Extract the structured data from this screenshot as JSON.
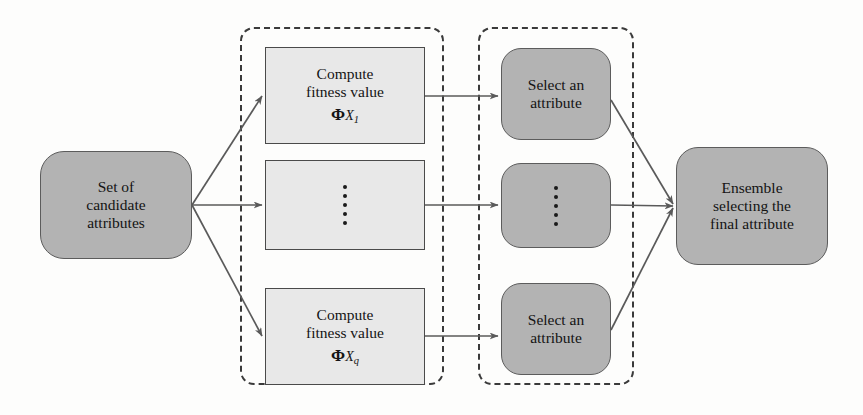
{
  "figure": {
    "type": "flow-diagram",
    "background_color": "#fdfdfc",
    "node_fill_round": "#b3b3b3",
    "node_fill_rect": "#e8e8e8",
    "edge_color": "#5a5a5a",
    "dashed_border_color": "#3a3a3a"
  },
  "nodes": {
    "candidates": {
      "id": "set-of-candidate-attributes",
      "shape": "rounded-rect",
      "lines": [
        "Set of",
        "candidate",
        "attributes"
      ]
    },
    "compute_first": {
      "id": "compute-fitness-value-x1",
      "shape": "rect",
      "lines": [
        "Compute",
        "fitness value"
      ],
      "symbol": "Φ",
      "symbol_var": "X",
      "symbol_sub": "1"
    },
    "compute_middle": {
      "id": "compute-fitness-ellipsis",
      "shape": "rect",
      "content": "vertical-ellipsis",
      "dots": 5
    },
    "compute_last": {
      "id": "compute-fitness-value-xq",
      "shape": "rect",
      "lines": [
        "Compute",
        "fitness value"
      ],
      "symbol": "Φ",
      "symbol_var": "X",
      "symbol_sub": "q"
    },
    "select_first": {
      "id": "select-an-attribute-top",
      "shape": "rounded-rect",
      "lines": [
        "Select an",
        "attribute"
      ]
    },
    "select_middle": {
      "id": "select-attribute-ellipsis",
      "shape": "rounded-rect",
      "content": "vertical-ellipsis",
      "dots": 5
    },
    "select_last": {
      "id": "select-an-attribute-bottom",
      "shape": "rounded-rect",
      "lines": [
        "Select an",
        "attribute"
      ]
    },
    "ensemble": {
      "id": "ensemble-selecting-final-attribute",
      "shape": "rounded-rect",
      "lines": [
        "Ensemble",
        "selecting the",
        "final attribute"
      ]
    }
  },
  "groups": {
    "compute_group": {
      "id": "compute-stage",
      "style": "dashed-rounded",
      "label": ""
    },
    "select_group": {
      "id": "select-stage",
      "style": "dashed-rounded",
      "label": ""
    }
  },
  "edges": [
    {
      "from": "candidates",
      "to": "compute_first",
      "style": "arrow"
    },
    {
      "from": "candidates",
      "to": "compute_middle",
      "style": "arrow"
    },
    {
      "from": "candidates",
      "to": "compute_last",
      "style": "arrow"
    },
    {
      "from": "compute_first",
      "to": "select_first",
      "style": "arrow"
    },
    {
      "from": "compute_middle",
      "to": "select_middle",
      "style": "arrow"
    },
    {
      "from": "compute_last",
      "to": "select_last",
      "style": "arrow"
    },
    {
      "from": "select_first",
      "to": "ensemble",
      "style": "arrow"
    },
    {
      "from": "select_middle",
      "to": "ensemble",
      "style": "arrow"
    },
    {
      "from": "select_last",
      "to": "ensemble",
      "style": "arrow"
    }
  ]
}
